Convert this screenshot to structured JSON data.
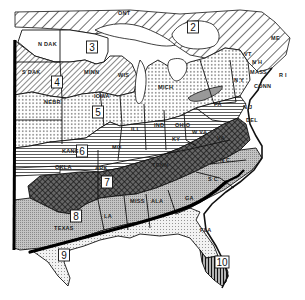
{
  "map": {
    "title": "Plant hardiness / climatic zones — Eastern United States",
    "colors": {
      "ink": "#111111",
      "paper": "#ffffff",
      "light_gray": "#d9d9d9",
      "mid_gray": "#a8a8a8"
    },
    "zones": [
      {
        "id": "2",
        "label": "2",
        "pattern": "hatch-wide",
        "x": 193,
        "y": 27
      },
      {
        "id": "3",
        "label": "3",
        "pattern": "blank",
        "x": 92,
        "y": 47
      },
      {
        "id": "4",
        "label": "4",
        "pattern": "hatch-diag",
        "x": 57,
        "y": 82
      },
      {
        "id": "5",
        "label": "5",
        "pattern": "dots",
        "x": 98,
        "y": 112
      },
      {
        "id": "6",
        "label": "6",
        "pattern": "horizontal-lines",
        "x": 82,
        "y": 151
      },
      {
        "id": "7",
        "label": "7",
        "pattern": "crosshatch-dark",
        "x": 107,
        "y": 182
      },
      {
        "id": "8",
        "label": "8",
        "pattern": "fine-gray",
        "x": 76,
        "y": 216
      },
      {
        "id": "9",
        "label": "9",
        "pattern": "light-dots",
        "x": 64,
        "y": 255
      },
      {
        "id": "10",
        "label": "10",
        "pattern": "vertical-lines",
        "x": 222,
        "y": 262
      }
    ],
    "states": [
      {
        "name": "N DAK",
        "x": 38,
        "y": 46
      },
      {
        "name": "S DAK",
        "x": 22,
        "y": 74
      },
      {
        "name": "NEBR",
        "x": 44,
        "y": 104
      },
      {
        "name": "MINN",
        "x": 84,
        "y": 74
      },
      {
        "name": "WIS",
        "x": 118,
        "y": 77
      },
      {
        "name": "IOWA",
        "x": 94,
        "y": 98
      },
      {
        "name": "MICH",
        "x": 158,
        "y": 89
      },
      {
        "name": "ILL",
        "x": 131,
        "y": 131
      },
      {
        "name": "IND",
        "x": 154,
        "y": 127
      },
      {
        "name": "OHIO",
        "x": 175,
        "y": 127
      },
      {
        "name": "PA",
        "x": 214,
        "y": 106
      },
      {
        "name": "N J",
        "x": 243,
        "y": 109
      },
      {
        "name": "DEL",
        "x": 246,
        "y": 122
      },
      {
        "name": "N Y",
        "x": 234,
        "y": 82
      },
      {
        "name": "VT",
        "x": 244,
        "y": 56
      },
      {
        "name": "N H",
        "x": 252,
        "y": 64
      },
      {
        "name": "MASS",
        "x": 250,
        "y": 74
      },
      {
        "name": "CONN",
        "x": 254,
        "y": 88
      },
      {
        "name": "R I",
        "x": 279,
        "y": 77
      },
      {
        "name": "ME",
        "x": 271,
        "y": 40
      },
      {
        "name": "ONT",
        "x": 118,
        "y": 15
      },
      {
        "name": "KANS",
        "x": 62,
        "y": 153
      },
      {
        "name": "MO",
        "x": 112,
        "y": 149
      },
      {
        "name": "OKLA",
        "x": 55,
        "y": 169
      },
      {
        "name": "ARK",
        "x": 95,
        "y": 170
      },
      {
        "name": "KY",
        "x": 172,
        "y": 141
      },
      {
        "name": "W VA",
        "x": 192,
        "y": 134
      },
      {
        "name": "VA",
        "x": 217,
        "y": 140
      },
      {
        "name": "TENN",
        "x": 152,
        "y": 167
      },
      {
        "name": "N C",
        "x": 220,
        "y": 162
      },
      {
        "name": "S C",
        "x": 208,
        "y": 181
      },
      {
        "name": "GA",
        "x": 185,
        "y": 200
      },
      {
        "name": "MISS",
        "x": 130,
        "y": 203
      },
      {
        "name": "ALA",
        "x": 151,
        "y": 203
      },
      {
        "name": "LA",
        "x": 104,
        "y": 218
      },
      {
        "name": "TEXAS",
        "x": 54,
        "y": 230
      },
      {
        "name": "FLA",
        "x": 200,
        "y": 232
      }
    ]
  }
}
